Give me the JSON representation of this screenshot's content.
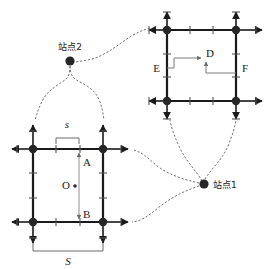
{
  "figure": {
    "type": "schematic-diagram",
    "background_color": "#ffffff",
    "line_color": "#1a1a1a",
    "node_color": "#262626",
    "thin_line_color": "#8c8c8c",
    "leader_color": "#5a5a5a"
  },
  "stations": {
    "station1": {
      "label": "站点1",
      "name": "station-1"
    },
    "station2": {
      "label": "站点2",
      "name": "station-2"
    }
  },
  "grid_upper": {
    "name": "upper-right-grid",
    "points": {
      "d": "D",
      "e": "E",
      "f": "F"
    }
  },
  "grid_lower": {
    "name": "lower-left-grid",
    "points": {
      "a": "A",
      "b": "B",
      "o": "O"
    },
    "dimensions": {
      "small_spacing": "s",
      "large_spacing": "S"
    }
  }
}
